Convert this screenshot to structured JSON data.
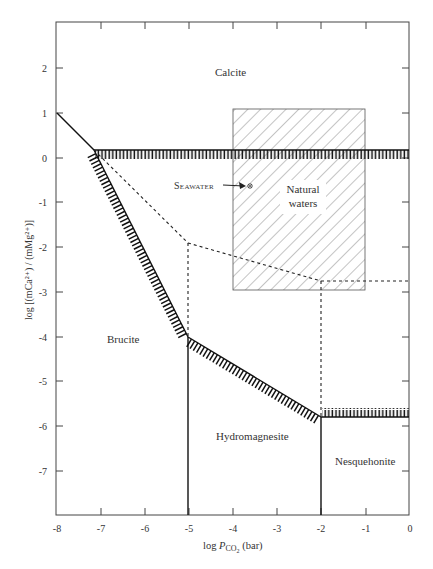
{
  "figure": {
    "type": "stability-diagram",
    "x_axis": {
      "label_prefix": "log ",
      "label_var": "P",
      "label_sub": "CO",
      "label_sub2": "2",
      "label_suffix": " (bar)",
      "ticks": [
        "-8",
        "-7",
        "-6",
        "-5",
        "-4",
        "-3",
        "-2",
        "-1",
        "0"
      ],
      "range": [
        -8,
        0
      ]
    },
    "y_axis": {
      "label": "log [(mCa²⁺) / (mMg²⁺)]",
      "ticks": [
        "2",
        "1",
        "0",
        "-1",
        "-2",
        "-3",
        "-4",
        "-5",
        "-6",
        "-7"
      ],
      "range": [
        -8,
        3
      ]
    },
    "regions": {
      "calcite": "Calcite",
      "brucite": "Brucite",
      "hydromagnesite": "Hydromagnesite",
      "nesquehonite": "Nesquehonite",
      "natural_waters_1": "Natural",
      "natural_waters_2": "waters"
    },
    "annotation": {
      "seawater": "Seawater"
    },
    "boundaries": {
      "solid": [
        [
          [
            -8,
            1
          ],
          [
            -7.15,
            0.18
          ]
        ],
        [
          [
            -7.15,
            0.18
          ],
          [
            0,
            0.18
          ]
        ],
        [
          [
            -7.15,
            0.18
          ],
          [
            -5,
            -4
          ]
        ],
        [
          [
            -5,
            -4
          ],
          [
            -2,
            -5.8
          ]
        ],
        [
          [
            -2,
            -5.8
          ],
          [
            0,
            -5.8
          ]
        ],
        [
          [
            -5,
            -4
          ],
          [
            -5,
            -8
          ]
        ],
        [
          [
            -2,
            -5.8
          ],
          [
            -2,
            -8
          ]
        ]
      ],
      "dashed": [
        [
          [
            -7.15,
            0.18
          ],
          [
            -5,
            -1.9
          ]
        ],
        [
          [
            -5,
            -1.9
          ],
          [
            -5,
            -4
          ]
        ],
        [
          [
            -5,
            -1.9
          ],
          [
            -2,
            -2.75
          ]
        ],
        [
          [
            -2,
            -2.75
          ],
          [
            0,
            -2.75
          ]
        ],
        [
          [
            -2,
            -2.75
          ],
          [
            -2,
            -5.8
          ]
        ]
      ]
    },
    "natural_waters_box": {
      "x": [
        -4,
        -1
      ],
      "y": [
        -2.95,
        1.1
      ]
    },
    "seawater_point": {
      "x": -3.6,
      "y": -0.6
    }
  }
}
